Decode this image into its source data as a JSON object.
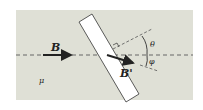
{
  "diagram": {
    "type": "physics-refraction-of-magnetic-field",
    "labels": {
      "incident_field": "B",
      "transmitted_field": "B'",
      "medium": "μ",
      "angle_theta": "θ",
      "angle_phi": "φ"
    },
    "colors": {
      "background": "#dfe0d6",
      "slab": "#ffffff",
      "stroke": "#222222"
    }
  }
}
